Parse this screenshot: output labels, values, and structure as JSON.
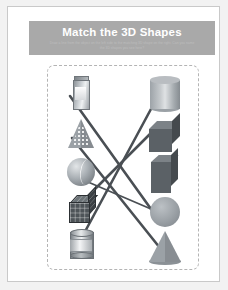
{
  "worksheet": {
    "title": "Match the 3D Shapes",
    "subtitle": "Draw a line from the object on the left side to the matching 3D shape on the right. Can you name the 3D shapes you see here?",
    "banner_color": "#a9a9a9",
    "page_background": "#ffffff",
    "activity_border_style": "dashed",
    "activity_border_color": "#b4b4b4"
  },
  "left_column": {
    "label": "real-world objects",
    "items": [
      {
        "id": "carton",
        "name": "juice-carton",
        "icon": "carton-icon",
        "answer": "rectangular-prism"
      },
      {
        "id": "partyhat",
        "name": "party-hat",
        "icon": "party-hat-icon",
        "answer": "cone"
      },
      {
        "id": "ball",
        "name": "ball",
        "icon": "ball-icon",
        "answer": "sphere"
      },
      {
        "id": "rubik",
        "name": "puzzle-cube",
        "icon": "rubik-cube-icon",
        "answer": "cube"
      },
      {
        "id": "tincan",
        "name": "tin-can",
        "icon": "tin-can-icon",
        "answer": "cylinder"
      }
    ]
  },
  "right_column": {
    "label": "3D shapes",
    "items": [
      {
        "id": "cylinder",
        "name": "cylinder",
        "icon": "cylinder-icon",
        "shape": "cylinder"
      },
      {
        "id": "cube",
        "name": "cube",
        "icon": "cube-icon",
        "shape": "cube"
      },
      {
        "id": "prism",
        "name": "rectangular-prism",
        "icon": "prism-icon",
        "shape": "rectangular prism"
      },
      {
        "id": "sphere",
        "name": "sphere",
        "icon": "sphere-icon",
        "shape": "sphere"
      },
      {
        "id": "cone",
        "name": "cone",
        "icon": "cone-icon",
        "shape": "cone"
      }
    ]
  },
  "connections": {
    "line_color": "#4a4f54",
    "line_width": 2.6,
    "drawn": [
      {
        "from": "carton",
        "to": "prism",
        "x1": 22,
        "y1": 30,
        "x2": 108,
        "y2": 150
      },
      {
        "from": "partyhat",
        "to": "cone",
        "x1": 24,
        "y1": 72,
        "x2": 112,
        "y2": 182
      },
      {
        "from": "ball",
        "to": "sphere",
        "x1": 26,
        "y1": 110,
        "x2": 110,
        "y2": 146
      },
      {
        "from": "rubik",
        "to": "cube",
        "x1": 24,
        "y1": 146,
        "x2": 108,
        "y2": 62
      },
      {
        "from": "tincan",
        "to": "cylinder",
        "x1": 26,
        "y1": 186,
        "x2": 110,
        "y2": 30
      }
    ]
  }
}
